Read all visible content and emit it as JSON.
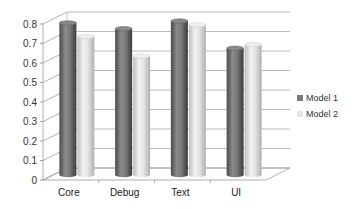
{
  "chart_data": {
    "type": "bar",
    "style": "3d-cylinder-clustered",
    "title": "",
    "xlabel": "",
    "ylabel": "",
    "categories": [
      "Core",
      "Debug",
      "Text",
      "UI"
    ],
    "series": [
      {
        "name": "Model 1",
        "values": [
          0.78,
          0.75,
          0.79,
          0.65
        ],
        "color": "#7a7a7a"
      },
      {
        "name": "Model 2",
        "values": [
          0.71,
          0.61,
          0.77,
          0.67
        ],
        "color": "#dcdcdc"
      }
    ],
    "ylim": [
      0,
      0.8
    ],
    "yticks": [
      "0",
      "0.1",
      "0.2",
      "0.3",
      "0.4",
      "0.5",
      "0.6",
      "0.7",
      "0.8"
    ],
    "grid": true,
    "legend_position": "right"
  },
  "legend": {
    "items": [
      {
        "label": "Model 1",
        "color": "#7a7a7a"
      },
      {
        "label": "Model 2",
        "color": "#dcdcdc"
      }
    ]
  }
}
